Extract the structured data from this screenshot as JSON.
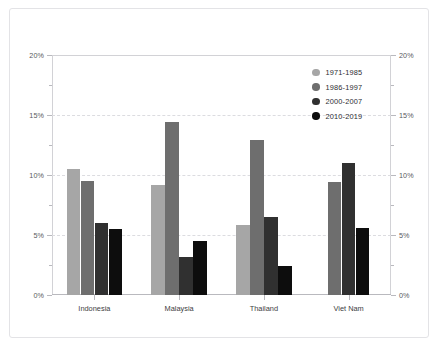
{
  "chart_data": {
    "type": "bar",
    "title": "",
    "subtitle": "",
    "xlabel": "",
    "ylabel": "",
    "categories": [
      "Indonesia",
      "Malaysia",
      "Thailand",
      "Viet Nam"
    ],
    "series": [
      {
        "name": "1971-1985",
        "color": "#a6a6a6",
        "values": [
          10.5,
          9.2,
          5.8,
          null
        ]
      },
      {
        "name": "1986-1997",
        "color": "#6e6e6e",
        "values": [
          9.5,
          14.4,
          12.9,
          9.4
        ]
      },
      {
        "name": "2000-2007",
        "color": "#303030",
        "values": [
          6.0,
          3.2,
          6.5,
          11.0
        ]
      },
      {
        "name": "2010-2019",
        "color": "#0d0d0d",
        "values": [
          5.5,
          4.5,
          2.4,
          5.6
        ]
      }
    ],
    "ylim": [
      0,
      20
    ],
    "y_major_ticks": [
      0,
      5,
      10,
      15,
      20
    ],
    "y_minor_ticks": [
      2.5,
      7.5,
      12.5,
      17.5
    ],
    "y_tick_labels_left": [
      "0%",
      "5%",
      "10%",
      "15%",
      "20%"
    ],
    "y_tick_labels_right": [
      "0%",
      "5%",
      "10%",
      "15%",
      "20%"
    ],
    "grid": true,
    "grid_axis": "y",
    "legend_position": "top-right",
    "dual_axis": true,
    "value_unit": "%"
  },
  "legend": {
    "entries": [
      {
        "label": "1971-1985",
        "color": "#a6a6a6"
      },
      {
        "label": "1986-1997",
        "color": "#6e6e6e"
      },
      {
        "label": "2000-2007",
        "color": "#303030"
      },
      {
        "label": "2010-2019",
        "color": "#0d0d0d"
      }
    ]
  },
  "colors": {
    "background": "#ffffff",
    "frame_border": "#e3e3e6",
    "gridline": "#dcdce0",
    "axis": "#b9b9be",
    "tick_text": "#58585c",
    "category_text": "#3d3d42"
  }
}
